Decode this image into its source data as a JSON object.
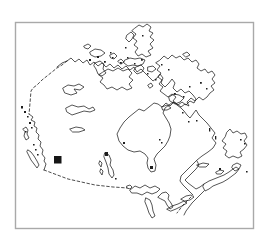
{
  "map": {
    "country": "Canada",
    "style": "hand-drawn outline map, no labels",
    "marker": {
      "shape": "filled-square",
      "x": 54,
      "y": 156,
      "size": 7.5,
      "region_hint": "Alberta / west-central Canada"
    },
    "frame": {
      "x": 15.5,
      "y": 22.5,
      "width": 238,
      "height": 206
    }
  },
  "colors": {
    "background": "#ffffff",
    "frame_stroke": "#a9a9a9",
    "line": "#1e1e1e",
    "marker_fill": "#161616"
  }
}
